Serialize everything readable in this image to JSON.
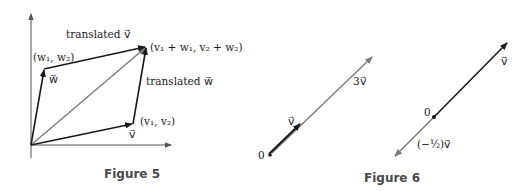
{
  "figure5": {
    "caption": "Figure 5",
    "labels": {
      "translated_v": "translated v⃗",
      "translated_w": "translated w⃗",
      "w_point": "(w₁, w₂)",
      "w_vec": "w⃗",
      "sum_point": "(v₁ + w₁, v₂ + w₂)",
      "v_point": "(v₁, v₂)",
      "v_vec": "v⃗"
    }
  },
  "figure6": {
    "caption": "Figure 6",
    "left": {
      "origin": "0",
      "v_vec": "v⃗",
      "three_v": "3v⃗"
    },
    "right": {
      "origin": "0",
      "v_vec": "v⃗",
      "neg_half_v": "(−½)v⃗"
    }
  },
  "colors": {
    "dark_vector": "#1a1a1a",
    "gray_vector": "#7a7a7a",
    "caption": "#4a4a4a"
  }
}
